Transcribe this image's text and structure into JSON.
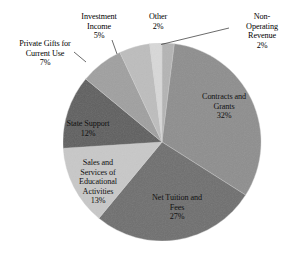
{
  "chart_data": {
    "type": "pie",
    "title": "",
    "subtitle": "",
    "xlabel": "",
    "ylabel": "",
    "legend_position": "none",
    "grid": false,
    "value_suffix": "%",
    "start_angle_deg": 0,
    "direction": "clockwise",
    "categories": [
      "Non-Operating Revenue",
      "Contracts and Grants",
      "Net Tuition and Fees",
      "Sales and Services of Educational Activities",
      "State Support",
      "Private Gifts for Current Use",
      "Investment Income",
      "Other"
    ],
    "values": [
      2,
      32,
      27,
      13,
      12,
      7,
      5,
      2
    ],
    "colors": [
      "#b4b4b4",
      "#8e8e8e",
      "#6f6f6f",
      "#c8c8c8",
      "#5f5f5f",
      "#a0a0a0",
      "#bdbdbd",
      "#d8d8d8"
    ],
    "slices": [
      {
        "name": "Non-Operating Revenue",
        "value": 2,
        "label_text": "Non-\nOperating\nRevenue\n2%",
        "label_placement": "outside",
        "leader_line": true,
        "color": "#b4b4b4"
      },
      {
        "name": "Contracts and Grants",
        "value": 32,
        "label_text": "Contracts and\nGrants\n32%",
        "label_placement": "inside",
        "leader_line": false,
        "color": "#8e8e8e"
      },
      {
        "name": "Net Tuition and Fees",
        "value": 27,
        "label_text": "Net Tuition and\nFees\n27%",
        "label_placement": "inside",
        "leader_line": false,
        "color": "#6f6f6f"
      },
      {
        "name": "Sales and Services of Educational Activities",
        "value": 13,
        "label_text": "Sales and\nServices of\nEducational\nActivities\n13%",
        "label_placement": "inside",
        "leader_line": false,
        "color": "#c8c8c8"
      },
      {
        "name": "State Support",
        "value": 12,
        "label_text": "State Support\n12%",
        "label_placement": "inside",
        "leader_line": false,
        "color": "#5f5f5f"
      },
      {
        "name": "Private Gifts for Current Use",
        "value": 7,
        "label_text": "Private Gifts for\nCurrent Use\n7%",
        "label_placement": "outside",
        "leader_line": true,
        "color": "#a0a0a0"
      },
      {
        "name": "Investment Income",
        "value": 5,
        "label_text": "Investment\nIncome\n5%",
        "label_placement": "outside",
        "leader_line": true,
        "color": "#bdbdbd"
      },
      {
        "name": "Other",
        "value": 2,
        "label_text": "Other\n2%",
        "label_placement": "outside",
        "leader_line": false,
        "color": "#d8d8d8"
      }
    ]
  },
  "labels": {
    "private_gifts": "Private Gifts for\nCurrent Use\n7%",
    "investment_income": "Investment\nIncome\n5%",
    "other": "Other\n2%",
    "non_operating": "Non-\nOperating\nRevenue\n2%",
    "contracts_grants": "Contracts and\nGrants\n32%",
    "net_tuition": "Net Tuition and\nFees\n27%",
    "sales_services": "Sales and\nServices of\nEducational\nActivities\n13%",
    "state_support": "State Support\n12%"
  }
}
